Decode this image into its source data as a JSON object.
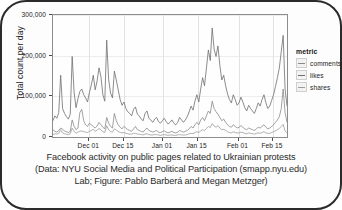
{
  "figure": {
    "y_axis_title": "Total count per day",
    "legend_title": "metric",
    "caption_lines": [
      "Facebook activity on public pages related to Ukrainian protests",
      "(Data: NYU Social Media and Political Participation (smapp.nyu.edu)",
      "Lab; Figure: Pablo Barberá and Megan Metzger)"
    ]
  },
  "chart_data": {
    "type": "line",
    "title": "",
    "xlabel": "",
    "ylabel": "Total count per day",
    "ylim": [
      0,
      300000
    ],
    "yticks": [
      0,
      100000,
      200000,
      300000
    ],
    "ytick_labels": [
      "0",
      "100,000",
      "200,000",
      "300,000"
    ],
    "xtick_labels": [
      "Dec 01",
      "Dec 15",
      "Jan 01",
      "Jan 15",
      "Feb 01",
      "Feb 15"
    ],
    "xtick_positions": [
      0.155,
      0.303,
      0.47,
      0.618,
      0.793,
      0.94
    ],
    "grid": true,
    "legend_position": "right",
    "colors": {
      "comments": "#8a8a8a",
      "likes": "#6e6e6e",
      "shares": "#9c9c9c"
    },
    "series": [
      {
        "name": "comments",
        "values": [
          18000,
          14000,
          12000,
          16000,
          22000,
          19000,
          15000,
          13000,
          11000,
          14000,
          42000,
          26000,
          18000,
          22000,
          60000,
          68000,
          40000,
          30000,
          26000,
          34000,
          30000,
          26000,
          22000,
          27000,
          36000,
          30000,
          24000,
          20000,
          48000,
          34000,
          26000,
          22000,
          58000,
          40000,
          30000,
          24000,
          20000,
          26000,
          22000,
          18000,
          16000,
          14000,
          20000,
          26000,
          18000,
          16000,
          14000,
          12000,
          18000,
          22000,
          16000,
          14000,
          12000,
          14000,
          16000,
          12000,
          11000,
          13000,
          15000,
          12000,
          10000,
          12000,
          14000,
          11000,
          10000,
          12000,
          16000,
          14000,
          12000,
          14000,
          16000,
          20000,
          26000,
          22000,
          30000,
          36000,
          30000,
          42000,
          48000,
          40000,
          52000,
          64000,
          58000,
          88000,
          70000,
          62000,
          56000,
          48000,
          40000,
          44000,
          36000,
          30000,
          26000,
          24000,
          30000,
          26000,
          22000,
          24000,
          28000,
          24000,
          20000,
          18000,
          22000,
          20000,
          18000,
          16000,
          20000,
          24000,
          22000,
          26000,
          30000,
          24000,
          20000,
          22000,
          26000,
          30000,
          36000,
          42000,
          50000,
          70000,
          118000,
          60000,
          36000
        ]
      },
      {
        "name": "likes",
        "values": [
          40000,
          52000,
          46000,
          60000,
          152000,
          70000,
          58000,
          50000,
          44000,
          56000,
          198000,
          110000,
          72000,
          94000,
          112000,
          118000,
          104000,
          96000,
          86000,
          110000,
          128000,
          152000,
          116000,
          138000,
          170000,
          148000,
          104000,
          88000,
          238000,
          142000,
          108000,
          96000,
          162000,
          140000,
          116000,
          92000,
          78000,
          86000,
          70000,
          62000,
          58000,
          52000,
          68000,
          74000,
          56000,
          52000,
          44000,
          40000,
          58000,
          64000,
          46000,
          42000,
          36000,
          44000,
          48000,
          38000,
          34000,
          40000,
          46000,
          38000,
          32000,
          36000,
          42000,
          34000,
          30000,
          36000,
          48000,
          42000,
          36000,
          42000,
          50000,
          62000,
          76000,
          66000,
          88000,
          104000,
          86000,
          118000,
          146000,
          126000,
          170000,
          214000,
          188000,
          268000,
          216000,
          198000,
          224000,
          176000,
          140000,
          152000,
          126000,
          106000,
          92000,
          84000,
          104000,
          92000,
          78000,
          84000,
          98000,
          86000,
          72000,
          64000,
          78000,
          70000,
          64000,
          58000,
          70000,
          84000,
          76000,
          92000,
          104000,
          84000,
          70000,
          76000,
          90000,
          104000,
          124000,
          146000,
          170000,
          210000,
          250000,
          118000,
          76000
        ]
      },
      {
        "name": "shares",
        "values": [
          6000,
          8000,
          7000,
          9000,
          18000,
          10000,
          8000,
          7000,
          6000,
          8000,
          22000,
          14000,
          9000,
          12000,
          14000,
          15000,
          13000,
          12000,
          11000,
          14000,
          16000,
          19000,
          14000,
          17000,
          21000,
          18000,
          13000,
          11000,
          28000,
          18000,
          13000,
          12000,
          20000,
          17000,
          14000,
          11000,
          10000,
          11000,
          9000,
          8000,
          7000,
          7000,
          9000,
          9000,
          7000,
          7000,
          6000,
          5000,
          7000,
          8000,
          6000,
          5000,
          5000,
          6000,
          6000,
          5000,
          4000,
          5000,
          6000,
          5000,
          4000,
          5000,
          5000,
          4000,
          4000,
          5000,
          6000,
          5000,
          5000,
          5000,
          6000,
          8000,
          9000,
          8000,
          11000,
          13000,
          11000,
          15000,
          18000,
          16000,
          21000,
          26000,
          23000,
          33000,
          27000,
          24000,
          28000,
          22000,
          18000,
          19000,
          16000,
          13000,
          11000,
          10000,
          13000,
          11000,
          10000,
          10000,
          12000,
          11000,
          9000,
          8000,
          10000,
          9000,
          8000,
          7000,
          9000,
          10000,
          9000,
          11000,
          13000,
          10000,
          9000,
          9000,
          11000,
          13000,
          15000,
          18000,
          21000,
          26000,
          31000,
          15000,
          10000
        ]
      }
    ]
  }
}
